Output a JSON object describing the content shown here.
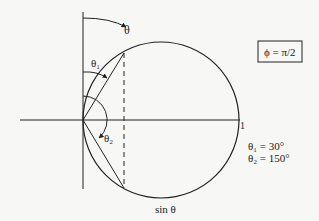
{
  "figure": {
    "type": "polar-radiation-pattern",
    "pattern_label": "sin θ",
    "angle_label": "θ",
    "theta1_label": "θ₁",
    "theta2_label": "θ₂",
    "unit_radius_label": "1",
    "phase_box": "ϕ = π/2",
    "annotations": [
      "θ₁ = 30°",
      "θ₂ = 150°"
    ]
  },
  "colors": {
    "background": "#f7f7f5",
    "ink": "#222222"
  }
}
